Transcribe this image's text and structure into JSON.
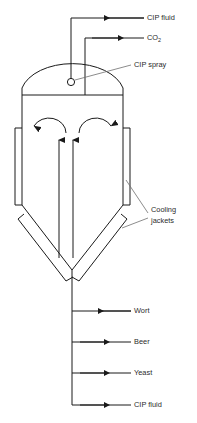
{
  "diagram": {
    "type": "process-flow-diagram",
    "colors": {
      "line": "#1a1a1a",
      "leader": "#6e6e6e",
      "text": "#2b2b2b",
      "background": "#ffffff"
    },
    "top_streams": [
      {
        "id": "cip-fluid-top",
        "label": "CIP fluid",
        "direction": "in",
        "arrow": "left",
        "y": 18
      },
      {
        "id": "co2-vent",
        "label": "CO",
        "sub": "2",
        "direction": "out",
        "arrow": "right",
        "y": 38
      }
    ],
    "annotations": [
      {
        "id": "cip-spray",
        "label": "CIP spray",
        "target": "spray-ball"
      },
      {
        "id": "cooling-jackets",
        "line1": "Cooling",
        "line2": "jackets",
        "target": "jackets"
      }
    ],
    "bottom_streams": [
      {
        "id": "wort",
        "label": "Wort",
        "direction": "in",
        "arrow": "left",
        "y": 311
      },
      {
        "id": "beer",
        "label": "Beer",
        "direction": "out",
        "arrow": "right",
        "y": 342
      },
      {
        "id": "yeast",
        "label": "Yeast",
        "direction": "out",
        "arrow": "right",
        "y": 373
      },
      {
        "id": "cip-fluid-bottom",
        "label": "CIP fluid",
        "direction": "out",
        "arrow": "right",
        "y": 405
      }
    ],
    "components": [
      {
        "id": "dome-head",
        "name": "Dome head"
      },
      {
        "id": "cylindrical-shell",
        "name": "Cylindrical shell"
      },
      {
        "id": "conical-bottom",
        "name": "Conical bottom"
      },
      {
        "id": "spray-ball",
        "name": "CIP spray ball"
      },
      {
        "id": "left-side-jacket",
        "name": "Left side cooling jacket"
      },
      {
        "id": "right-side-jacket",
        "name": "Right side cooling jacket"
      },
      {
        "id": "left-cone-jacket",
        "name": "Left cone cooling jacket"
      },
      {
        "id": "right-cone-jacket",
        "name": "Right cone cooling jacket"
      },
      {
        "id": "outlet-pipe",
        "name": "Bottom outlet pipe"
      },
      {
        "id": "circulation-arrows",
        "name": "Internal circulation arrows"
      }
    ]
  }
}
